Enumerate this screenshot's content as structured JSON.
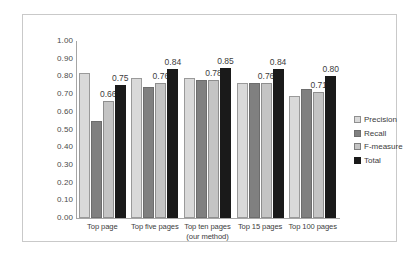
{
  "chart_data": {
    "type": "bar",
    "title": "",
    "xlabel": "",
    "ylabel": "",
    "ylim": [
      0,
      1.0
    ],
    "ytick_step": 0.1,
    "grid": false,
    "legend_position": "right",
    "categories": [
      "Top page",
      "Top five pages",
      "Top ten pages",
      "Top 15 pages",
      "Top 100 pages"
    ],
    "category_sublabels": [
      "",
      "",
      "(our method)",
      "",
      ""
    ],
    "ytick_labels": [
      "1.00",
      "0.90",
      "0.80",
      "0.70",
      "0.60",
      "0.50",
      "0.40",
      "0.30",
      "0.20",
      "0.10",
      "0.00"
    ],
    "series": [
      {
        "name": "Precision",
        "color": "#d9d9d9",
        "values": [
          0.82,
          0.79,
          0.79,
          0.76,
          0.69
        ],
        "labels": [
          "",
          "",
          "",
          "",
          ""
        ]
      },
      {
        "name": "Recall",
        "color": "#808080",
        "values": [
          0.55,
          0.74,
          0.78,
          0.76,
          0.73
        ],
        "labels": [
          "",
          "",
          "",
          "",
          ""
        ]
      },
      {
        "name": "F-measure",
        "color": "#c4c4c4",
        "values": [
          0.66,
          0.76,
          0.78,
          0.76,
          0.71
        ],
        "labels": [
          "0.66",
          "0.76",
          "0.78",
          "0.76",
          "0.71"
        ]
      },
      {
        "name": "Total",
        "color": "#1a1a1a",
        "values": [
          0.75,
          0.84,
          0.85,
          0.84,
          0.8
        ],
        "labels": [
          "0.75",
          "0.84",
          "0.85",
          "0.84",
          "0.80"
        ]
      }
    ]
  }
}
